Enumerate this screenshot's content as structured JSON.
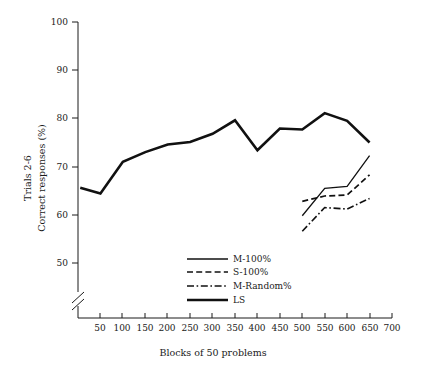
{
  "chart_data": {
    "type": "line",
    "title": "",
    "xlabel": "Blocks of 50 problems",
    "ylabel_line1": "Trials 2-6",
    "ylabel_line2": "Correct responses (%)",
    "xlim": [
      0,
      700
    ],
    "ylim": [
      45,
      100
    ],
    "y_axis_break": true,
    "y_break_note": "axis broken below 50",
    "grid": false,
    "legend_position": "bottom-center-inside",
    "xticks": [
      50,
      100,
      150,
      200,
      250,
      300,
      350,
      400,
      450,
      500,
      550,
      600,
      650,
      700
    ],
    "xtick_labels": [
      "50",
      "100",
      "150",
      "200",
      "250",
      "300",
      "350",
      "400",
      "450",
      "500",
      "550",
      "600",
      "650",
      "700"
    ],
    "yticks": [
      50,
      60,
      70,
      80,
      90,
      100
    ],
    "ytick_labels": [
      "50",
      "60",
      "70",
      "80",
      "90",
      "100"
    ],
    "series": [
      {
        "name": "M-100%",
        "style": "solid-thin",
        "x": [
          500,
          550,
          600,
          650
        ],
        "values": [
          59.8,
          65.5,
          65.9,
          72.3
        ]
      },
      {
        "name": "S-100%",
        "style": "dashed",
        "x": [
          500,
          550,
          600,
          650
        ],
        "values": [
          62.8,
          63.9,
          64.1,
          68.3
        ]
      },
      {
        "name": "M-Random%",
        "style": "dash-dot",
        "x": [
          500,
          550,
          600,
          650
        ],
        "values": [
          56.6,
          61.5,
          61.2,
          63.4
        ]
      },
      {
        "name": "LS",
        "style": "solid-thick",
        "x": [
          5,
          50,
          100,
          150,
          200,
          250,
          300,
          350,
          400,
          450,
          500,
          550,
          600,
          650
        ],
        "values": [
          65.6,
          64.4,
          71.0,
          73.0,
          74.6,
          75.1,
          76.8,
          79.6,
          73.4,
          77.9,
          77.7,
          81.1,
          79.5,
          75.0
        ]
      }
    ]
  },
  "legend": {
    "items": [
      {
        "label": "M-100%",
        "style": "solid-thin"
      },
      {
        "label": "S-100%",
        "style": "dashed"
      },
      {
        "label": "M-Random%",
        "style": "dash-dot"
      },
      {
        "label": "LS",
        "style": "solid-thick"
      }
    ]
  }
}
